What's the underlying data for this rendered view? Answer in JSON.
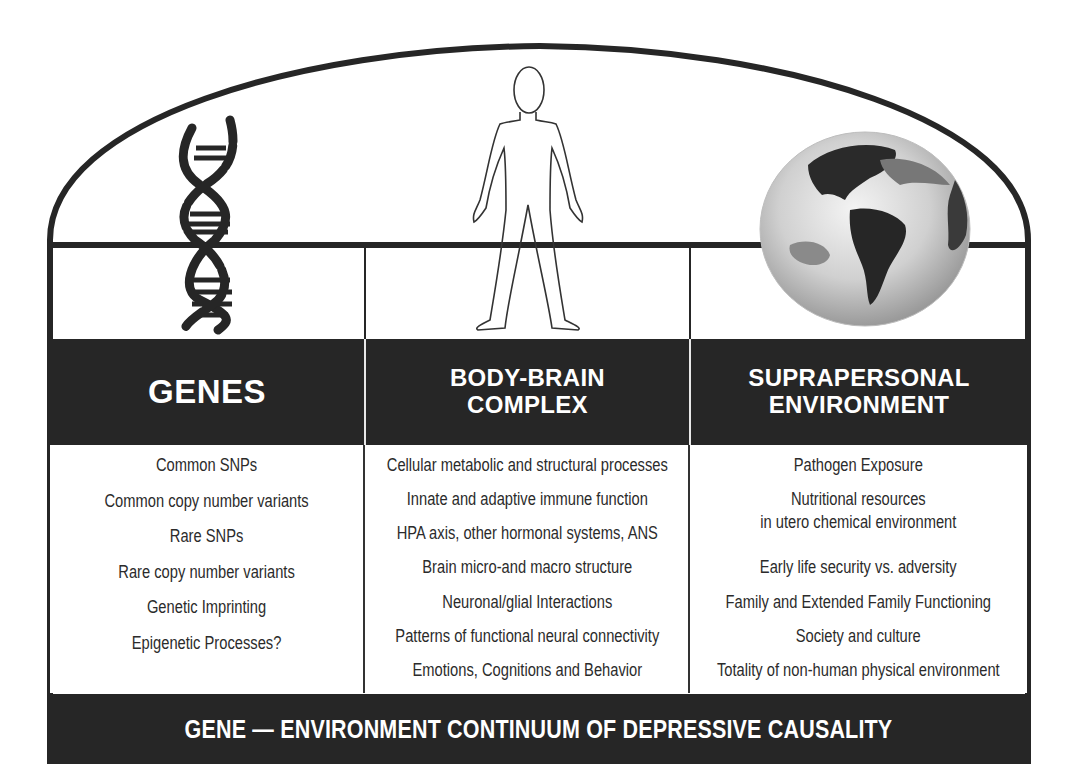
{
  "diagram": {
    "title": "GENE — ENVIRONMENT CONTINUUM OF DEPRESSIVE CAUSALITY",
    "colors": {
      "frame": "#262626",
      "band_fill": "#262626",
      "band_text": "#ffffff",
      "body_text": "#2b2b2b",
      "background": "#ffffff"
    },
    "columns": [
      {
        "icon": "dna-helix-icon",
        "header_lines": [
          "GENES"
        ],
        "items": [
          "Common SNPs",
          "Common copy number variants",
          "Rare SNPs",
          "Rare copy number variants",
          "Genetic Imprinting",
          "Epigenetic Processes?"
        ]
      },
      {
        "icon": "human-body-outline-icon",
        "header_lines": [
          "BODY-BRAIN",
          "COMPLEX"
        ],
        "items": [
          "Cellular metabolic and structural processes",
          "Innate and adaptive immune function",
          "HPA axis, other hormonal systems, ANS",
          "Brain micro-and macro structure",
          "Neuronal/glial Interactions",
          "Patterns of functional neural connectivity",
          "Emotions, Cognitions and Behavior"
        ]
      },
      {
        "icon": "globe-americas-icon",
        "header_lines": [
          "SUPRAPERSONAL",
          "ENVIRONMENT"
        ],
        "items": [
          "Pathogen Exposure",
          "Nutritional resources",
          "in utero chemical environment",
          "Early life security vs. adversity",
          "Family and Extended Family Functioning",
          "Society and culture",
          "Totality of non-human physical environment"
        ]
      }
    ]
  }
}
